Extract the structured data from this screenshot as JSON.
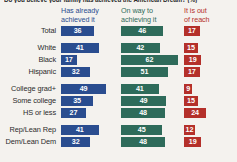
{
  "title": "Do you believe your family has achieved the American Dream? (%)",
  "legend": [
    {
      "name": "has-already-achieved-it",
      "line1": "Has already",
      "line2": "achieved it",
      "color": "#2a4d8f"
    },
    {
      "name": "on-way-to-achieving-it",
      "line1": "On way to",
      "line2": "achieving it",
      "color": "#2e6b5a"
    },
    {
      "name": "it-is-out-of-reach",
      "line1": "It is out",
      "line2": "of reach",
      "color": "#b4302a"
    }
  ],
  "colors": {
    "blue": "#2a4d8f",
    "green": "#2e6b5a",
    "red": "#b4302a",
    "background": "#f4f2ee",
    "text": "#2b2b2b"
  },
  "chart_data": {
    "type": "bar",
    "title": "Do you believe your family has achieved the American Dream? (%)",
    "xlabel": "",
    "ylabel": "",
    "xlim": [
      0,
      100
    ],
    "grid": false,
    "legend_position": "top",
    "orientation": "horizontal",
    "categories": [
      "Total",
      "White",
      "Black",
      "Hispanic",
      "College grad+",
      "Some college",
      "HS or less",
      "Rep/Lean Rep",
      "Dem/Lean Dem"
    ],
    "series": [
      {
        "name": "Has already achieved it",
        "color": "#2a4d8f",
        "values": [
          36,
          41,
          17,
          32,
          49,
          35,
          27,
          41,
          32
        ]
      },
      {
        "name": "On way to achieving it",
        "color": "#2e6b5a",
        "values": [
          46,
          42,
          62,
          51,
          41,
          49,
          48,
          45,
          48
        ]
      },
      {
        "name": "It is out of reach",
        "color": "#b4302a",
        "values": [
          17,
          15,
          19,
          17,
          9,
          15,
          24,
          12,
          19
        ]
      }
    ]
  },
  "groups": [
    {
      "name": "total",
      "rows": [
        {
          "label": "Total",
          "blue": 36,
          "green": 46,
          "red": 17
        }
      ]
    },
    {
      "name": "race",
      "rows": [
        {
          "label": "White",
          "blue": 41,
          "green": 42,
          "red": 15
        },
        {
          "label": "Black",
          "blue": 17,
          "green": 62,
          "red": 19
        },
        {
          "label": "Hispanic",
          "blue": 32,
          "green": 51,
          "red": 17
        }
      ]
    },
    {
      "name": "education",
      "rows": [
        {
          "label": "College grad+",
          "blue": 49,
          "green": 41,
          "red": 9
        },
        {
          "label": "Some college",
          "blue": 35,
          "green": 49,
          "red": 15
        },
        {
          "label": "HS or less",
          "blue": 27,
          "green": 48,
          "red": 24
        }
      ]
    },
    {
      "name": "party",
      "rows": [
        {
          "label": "Rep/Lean Rep",
          "blue": 41,
          "green": 45,
          "red": 12
        },
        {
          "label": "Dem/Lean Dem",
          "blue": 32,
          "green": 48,
          "red": 19
        }
      ]
    }
  ]
}
